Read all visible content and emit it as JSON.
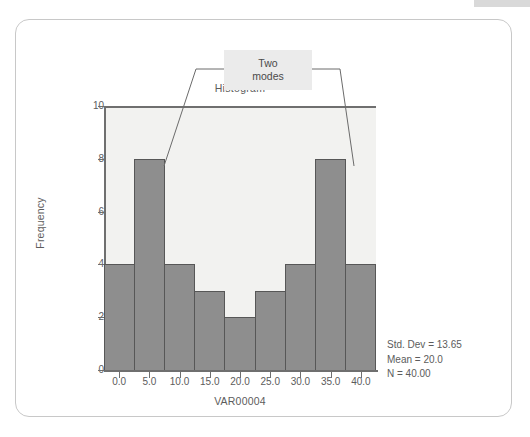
{
  "card": {
    "annotation": {
      "label_line1": "Two",
      "label_line2": "modes",
      "box_color": "#ebebeb"
    },
    "stats": {
      "std_dev": "Std. Dev = 13.65",
      "mean": "Mean = 20.0",
      "n": "N = 40.00"
    }
  },
  "chart_data": {
    "type": "bar",
    "title": "Histogram",
    "xlabel": "VAR00004",
    "ylabel": "Frequency",
    "categories": [
      "0.0",
      "5.0",
      "10.0",
      "15.0",
      "20.0",
      "25.0",
      "30.0",
      "35.0",
      "40.0"
    ],
    "values": [
      4,
      8,
      4,
      3,
      2,
      3,
      4,
      8,
      4
    ],
    "x_tick_labels": [
      "0.0",
      "5.0",
      "10.0",
      "15.0",
      "20.0",
      "25.0",
      "30.0",
      "35.0",
      "40.0"
    ],
    "y_tick_labels": [
      "0",
      "2",
      "4",
      "6",
      "8",
      "10"
    ],
    "ylim": [
      0,
      10
    ],
    "xlim": [
      -2.5,
      42.5
    ],
    "grid": false,
    "legend": false,
    "bar_color": "#8e8e8e",
    "bar_edge_color": "#575757",
    "plot_background": "#f2f2f0",
    "annotations": [
      {
        "text": "Two modes",
        "points_to": [
          "5.0",
          "35.0"
        ]
      }
    ]
  }
}
